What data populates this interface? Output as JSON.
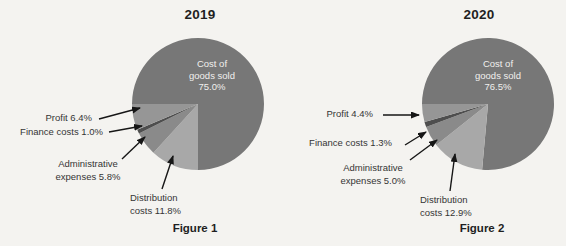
{
  "page": {
    "background_color": "#f4f3f0",
    "text_color": "#353535"
  },
  "figures": [
    {
      "title": "2019",
      "caption": "Figure 1",
      "center_label": "Cost of\ngoods sold\n75.0%",
      "callouts": {
        "profit": "Profit 6.4%",
        "finance": "Finance costs 1.0%",
        "admin": "Administrative\nexpenses 5.8%",
        "distribution": "Distribution\ncosts 11.8%"
      }
    },
    {
      "title": "2020",
      "caption": "Figure 2",
      "center_label": "Cost of\ngoods sold\n76.5%",
      "callouts": {
        "profit": "Profit 4.4%",
        "finance": "Finance costs 1.3%",
        "admin": "Administrative\nexpenses 5.0%",
        "distribution": "Distribution\ncosts 12.9%"
      }
    }
  ],
  "chart_data": [
    {
      "type": "pie",
      "title": "2019",
      "caption": "Figure 1",
      "start_angle_deg": 270,
      "direction": "clockwise",
      "legend_position": "left-callouts",
      "slices": [
        {
          "label": "Cost of goods sold",
          "value": 75.0,
          "color": "#777777"
        },
        {
          "label": "Distribution costs",
          "value": 11.8,
          "color": "#a8a8a8"
        },
        {
          "label": "Administrative expenses",
          "value": 5.8,
          "color": "#8a8a8a"
        },
        {
          "label": "Finance costs",
          "value": 1.0,
          "color": "#4e4e4e"
        },
        {
          "label": "Profit",
          "value": 6.4,
          "color": "#969696"
        }
      ]
    },
    {
      "type": "pie",
      "title": "2020",
      "caption": "Figure 2",
      "start_angle_deg": 270,
      "direction": "clockwise",
      "legend_position": "left-callouts",
      "slices": [
        {
          "label": "Cost of goods sold",
          "value": 76.5,
          "color": "#777777"
        },
        {
          "label": "Distribution costs",
          "value": 12.9,
          "color": "#a8a8a8"
        },
        {
          "label": "Administrative expenses",
          "value": 5.0,
          "color": "#8a8a8a"
        },
        {
          "label": "Finance costs",
          "value": 1.3,
          "color": "#4e4e4e"
        },
        {
          "label": "Profit",
          "value": 4.4,
          "color": "#969696"
        }
      ],
      "arrow_color": "#161616"
    }
  ]
}
